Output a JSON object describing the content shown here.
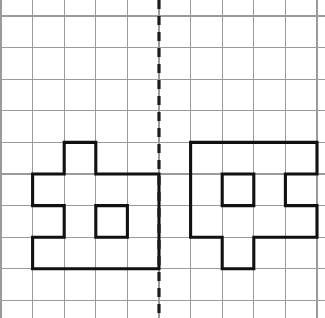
{
  "canvas": {
    "width": 325,
    "height": 318,
    "background_color": "#ffffff",
    "title": "grid-reflection-worksheet"
  },
  "grid": {
    "name": "square-grid",
    "origin_x": 1,
    "origin_y": 16,
    "cell_size": 31.6,
    "columns": 10,
    "rows": 9,
    "line_color": "#9a9a9a",
    "line_width": 1.1
  },
  "mirror_line": {
    "name": "line-of-symmetry",
    "orientation": "vertical",
    "column_index": 5,
    "x": 159,
    "y_start": 0,
    "y_end": 318,
    "color": "#1a1a1a",
    "dash_pattern": "9 7",
    "width": 3.2
  },
  "figures": [
    {
      "name": "left-figure",
      "label": "original-shape",
      "stroke_color": "#111111",
      "stroke_width": 3.1,
      "fill": "none",
      "cells": [
        {
          "col": 2,
          "row": 4
        },
        {
          "col": 1,
          "row": 5
        },
        {
          "col": 2,
          "row": 5
        },
        {
          "col": 3,
          "row": 5
        },
        {
          "col": 4,
          "row": 5
        },
        {
          "col": 2,
          "row": 6
        },
        {
          "col": 4,
          "row": 6
        },
        {
          "col": 1,
          "row": 7
        },
        {
          "col": 2,
          "row": 7
        },
        {
          "col": 3,
          "row": 7
        },
        {
          "col": 4,
          "row": 7
        }
      ],
      "outline_points": [
        [
          2,
          4
        ],
        [
          3,
          4
        ],
        [
          3,
          5
        ],
        [
          4,
          5
        ],
        [
          4,
          6
        ],
        [
          5,
          6
        ],
        [
          5,
          5
        ],
        [
          4,
          5
        ],
        [
          4,
          4
        ],
        [
          3,
          4
        ],
        [
          3,
          5
        ],
        [
          1,
          5
        ],
        [
          1,
          6
        ],
        [
          2,
          6
        ],
        [
          2,
          7
        ],
        [
          1,
          7
        ],
        [
          1,
          8
        ],
        [
          5,
          8
        ],
        [
          5,
          6
        ],
        [
          4,
          6
        ],
        [
          4,
          7
        ],
        [
          3,
          7
        ],
        [
          3,
          6
        ],
        [
          2,
          6
        ],
        [
          2,
          5
        ],
        [
          1,
          5
        ]
      ],
      "path": "M 64.2,142.4 L 95.8,142.4 L 95.8,174.0 L 127.4,174.0 L 127.4,205.6 L 159.0,205.6 L 159.0,174.0 L 127.4,174.0 L 127.4,142.4"
    },
    {
      "name": "right-figure",
      "label": "reflected-shape",
      "stroke_color": "#111111",
      "stroke_width": 3.1,
      "fill": "none",
      "cells": [
        {
          "col": 6,
          "row": 4
        },
        {
          "col": 7,
          "row": 4
        },
        {
          "col": 8,
          "row": 4
        },
        {
          "col": 9,
          "row": 4
        },
        {
          "col": 6,
          "row": 5
        },
        {
          "col": 8,
          "row": 5
        },
        {
          "col": 6,
          "row": 6
        },
        {
          "col": 7,
          "row": 6
        },
        {
          "col": 8,
          "row": 6
        },
        {
          "col": 9,
          "row": 6
        },
        {
          "col": 7,
          "row": 7
        }
      ]
    }
  ],
  "colors": {
    "background": "#ffffff",
    "grid": "#9a9a9a",
    "figure_stroke": "#111111",
    "mirror_stroke": "#1a1a1a"
  }
}
